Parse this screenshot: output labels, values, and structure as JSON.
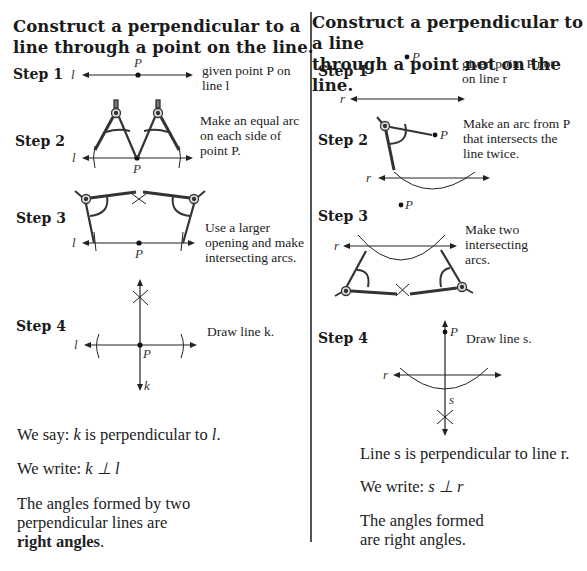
{
  "left": {
    "title_line1": "Construct a perpendicular to a",
    "title_line2": "line through a point on the line.",
    "steps": [
      {
        "label": "Step 1",
        "desc_line1": "given point P on",
        "desc_line2": "line l"
      },
      {
        "label": "Step 2",
        "desc_line1": "Make an equal arc",
        "desc_line2": "on each side of",
        "desc_line3": "point P."
      },
      {
        "label": "Step 3",
        "desc_line1": "Use a larger",
        "desc_line2": "opening and make",
        "desc_line3": "intersecting arcs."
      },
      {
        "label": "Step 4",
        "desc_line1": "Draw line k."
      }
    ],
    "say_prefix": "We say: ",
    "say_var1": "k",
    "say_middle": " is perpendicular to ",
    "say_var2": "l",
    "say_suffix": ".",
    "write_prefix": "We write: ",
    "write_expr": "k ⊥ l",
    "angles_line1": "The angles formed by two",
    "angles_line2": "perpendicular lines are",
    "angles_bold": "right angles",
    "angles_end": "."
  },
  "right": {
    "title_line1": "Construct a perpendicular to a line",
    "title_line2": "through a point not on the line.",
    "steps": [
      {
        "label": "Step 1",
        "desc_line1": "given point P not",
        "desc_line2": "on line r"
      },
      {
        "label": "Step 2",
        "desc_line1": "Make an arc from P",
        "desc_line2": "that intersects the",
        "desc_line3": "line twice."
      },
      {
        "label": "Step 3",
        "desc_line1": "Make two",
        "desc_line2": "intersecting",
        "desc_line3": "arcs."
      },
      {
        "label": "Step 4",
        "desc_line1": "Draw line s."
      }
    ],
    "line_statement": "Line s is perpendicular to line r.",
    "write_prefix": "We write: ",
    "write_expr": "s ⊥ r",
    "angles_line1": "The angles formed",
    "angles_line2": "are right angles."
  },
  "labels": {
    "P": "P",
    "l": "l",
    "k": "k",
    "r": "r",
    "s": "s"
  }
}
